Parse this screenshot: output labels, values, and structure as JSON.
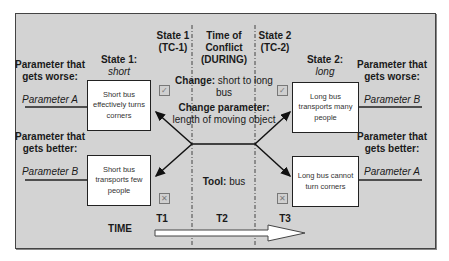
{
  "left": {
    "worse": {
      "label": "Parameter that gets worse:",
      "param": "Parameter A"
    },
    "better": {
      "label": "Parameter that gets better:",
      "param": "Parameter B"
    },
    "state_title": "State 1:",
    "state_value": "short",
    "box_top": "Short bus effectively turns corners",
    "box_bottom": "Short bus transports few people"
  },
  "right": {
    "worse": {
      "label": "Parameter that gets worse:",
      "param": "Parameter B"
    },
    "better": {
      "label": "Parameter that gets better:",
      "param": "Parameter A"
    },
    "state_title": "State 2:",
    "state_value": "long",
    "box_top": "Long bus transports many people",
    "box_bottom": "Long bus cannot turn corners"
  },
  "headers": {
    "state1": "State 1 (TC-1)",
    "conflict": "Time of Conflict (DURING)",
    "state2": "State 2 (TC-2)"
  },
  "middle": {
    "change_label": "Change:",
    "change_value": "short to long bus",
    "change_param_label": "Change parameter:",
    "change_param_value": "length of moving object",
    "tool_label": "Tool:",
    "tool_value": "bus"
  },
  "icons": {
    "positive": "checkbox-checked-icon",
    "negative": "checkbox-x-icon"
  },
  "timeline": {
    "label": "TIME",
    "t1": "T1",
    "t2": "T2",
    "t3": "T3"
  }
}
